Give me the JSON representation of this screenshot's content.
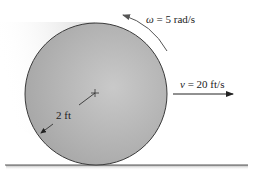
{
  "diagram": {
    "angular_velocity": {
      "symbol": "ω",
      "equals": " = ",
      "value": "5 rad/s",
      "direction": "counterclockwise"
    },
    "linear_velocity": {
      "symbol": "v",
      "equals": " = ",
      "value": "20 ft/s",
      "direction": "right"
    },
    "radius": {
      "label": "2 ft"
    },
    "colors": {
      "disk_fill": "#b4b4b4",
      "disk_outline": "#3a3a3a",
      "ground": "#555555",
      "shadow": "#d0d0d0",
      "text": "#222222",
      "arrow": "#222222"
    }
  }
}
